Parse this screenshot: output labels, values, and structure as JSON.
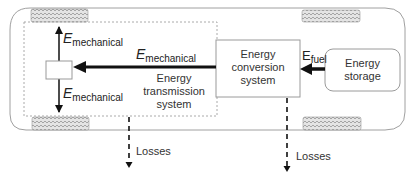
{
  "diagram": {
    "title": "",
    "nodes": [
      {
        "id": "energy-storage",
        "label": "Energy storage",
        "lines": [
          "Energy",
          "storage"
        ]
      },
      {
        "id": "energy-conversion-system",
        "label": "Energy conversion system",
        "lines": [
          "Energy",
          "conversion",
          "system"
        ]
      },
      {
        "id": "energy-transmission-system",
        "label": "Energy transmission system",
        "lines": [
          "Energy",
          "transmission",
          "system"
        ]
      },
      {
        "id": "wheel-hub",
        "label": ""
      }
    ],
    "edges": [
      {
        "from": "energy-storage",
        "to": "energy-conversion-system",
        "label": "E_fuel"
      },
      {
        "from": "energy-conversion-system",
        "to": "wheel-hub",
        "label": "E_mechanical"
      },
      {
        "from": "wheel-hub",
        "to": "front-wheel",
        "label": "E_mechanical"
      },
      {
        "from": "wheel-hub",
        "to": "rear-wheel",
        "label": "E_mechanical"
      },
      {
        "from": "energy-transmission-system",
        "to": "losses",
        "label": "Losses",
        "style": "dashed"
      },
      {
        "from": "energy-conversion-system",
        "to": "losses",
        "label": "Losses",
        "style": "dashed"
      }
    ],
    "labels": {
      "e_symbol": "E",
      "mechanical": "mechanical",
      "fuel": "fuel",
      "losses": "Losses"
    },
    "colors": {
      "line": "#111111",
      "outline": "#9a9a9a",
      "dashed_box": "#aaaaaa",
      "wheel": "#bdbdbd"
    }
  }
}
